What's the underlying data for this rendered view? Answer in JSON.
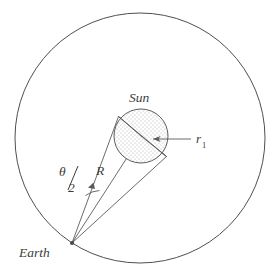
{
  "figure": {
    "kind": "geometry-diagram"
  },
  "labels": {
    "sun": "Sun",
    "earth": "Earth",
    "distance": "R",
    "radius_symbol": "r",
    "radius_subscript": "1",
    "angle_numerator": "θ",
    "angle_denominator": "2"
  },
  "colors": {
    "stroke": "#5a5a5a",
    "orbit_stroke": "#4f4f4f",
    "sun_fill_base": "#ffffff",
    "sun_stipple": "#b9b9b9",
    "text": "#3c3c3c",
    "background": "#ffffff"
  },
  "geometry": {
    "orbit": {
      "cx": 140,
      "cy": 138,
      "r": 125
    },
    "sun": {
      "cx": 141,
      "cy": 136,
      "r": 27
    },
    "earth": {
      "x": 72,
      "y": 243
    },
    "radius_arrow": {
      "tip_x": 152,
      "tip_y": 139,
      "tail_x": 191,
      "tail_y": 139
    },
    "angle_arc": {
      "x": 92,
      "y": 186
    }
  },
  "icons": {
    "arrowhead": "arrowhead-icon",
    "angle_marker": "angle-arc-icon"
  }
}
